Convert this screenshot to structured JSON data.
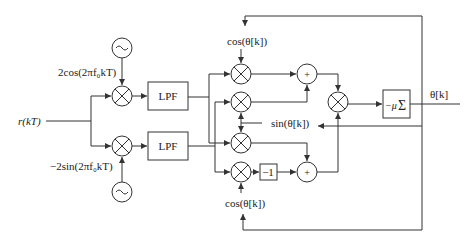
{
  "diagram": {
    "input_label": "r(kT)",
    "output_label": "θ[k]",
    "oscillator_top_label": "2cos(2πf₀kT)",
    "oscillator_bottom_label": "−2sin(2πf₀kT)",
    "lpf_top_label": "LPF",
    "lpf_bottom_label": "LPF",
    "cos_top_label": "cos(θ[k])",
    "sin_label": "sin(θ[k])",
    "cos_bottom_label": "cos(θ[k])",
    "neg_one_label": "−1",
    "adder_symbol": "+",
    "integrator_label": "−μ Σ",
    "oscillator_symbol": "~"
  }
}
